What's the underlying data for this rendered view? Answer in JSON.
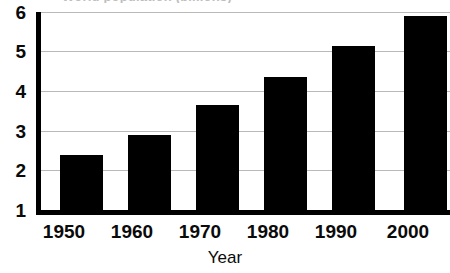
{
  "chart_data": {
    "type": "bar",
    "title": "World population (billions)",
    "title_clipped": true,
    "xlabel": "Year",
    "ylabel": "",
    "categories": [
      "1950",
      "1960",
      "1970",
      "1980",
      "1990",
      "2000"
    ],
    "values": [
      2.4,
      2.9,
      3.65,
      4.35,
      5.15,
      5.9
    ],
    "series": [
      {
        "name": "Population",
        "values": [
          2.4,
          2.9,
          3.65,
          4.35,
          5.15,
          5.9
        ]
      }
    ],
    "ylim": [
      1,
      6
    ],
    "yticks": [
      1,
      2,
      3,
      4,
      5,
      6
    ],
    "ytick_labels": [
      "1",
      "2",
      "3",
      "4",
      "5",
      "6"
    ],
    "xtick_labels": [
      "1950",
      "1960",
      "1970",
      "1980",
      "1990",
      "2000"
    ],
    "grid": true,
    "grid_axis": "y",
    "legend": false,
    "legend_position": "none",
    "bar_color": "#000000",
    "grid_color": "#b9b9b9",
    "axis_color": "#000000",
    "background_color": "#ffffff"
  },
  "axes": {
    "y_labels": [
      "6",
      "5",
      "4",
      "3",
      "2",
      "1"
    ],
    "x_labels": [
      "1950",
      "1960",
      "1970",
      "1980",
      "1990",
      "2000"
    ],
    "x_title": "Year"
  }
}
